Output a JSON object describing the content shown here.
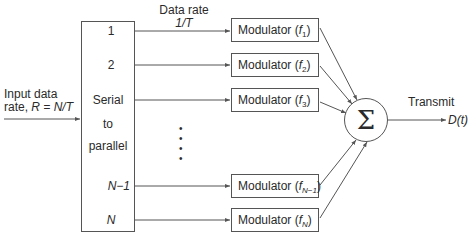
{
  "diagram": {
    "input": {
      "label_line1": "Input data",
      "label_line2_prefix": "rate, ",
      "label_line2_math": "R = N/T"
    },
    "data_rate": {
      "label_line1": "Data rate",
      "label_line2": "1/T"
    },
    "serial_to_parallel": {
      "line1": "Serial",
      "line2": "to",
      "line3": "parallel",
      "outputs": [
        "1",
        "2",
        "N−1",
        "N"
      ]
    },
    "ellipsis": "•",
    "modulators": [
      {
        "label": "Modulator (",
        "freq": "f",
        "sub": "1",
        "close": ")"
      },
      {
        "label": "Modulator (",
        "freq": "f",
        "sub": "2",
        "close": ")"
      },
      {
        "label": "Modulator (",
        "freq": "f",
        "sub": "3",
        "close": ")"
      },
      {
        "label": "Modulator (",
        "freq": "f",
        "sub": "N−1",
        "close": ")"
      },
      {
        "label": "Modulator (",
        "freq": "f",
        "sub": "N",
        "close": ")"
      }
    ],
    "summer": {
      "symbol": "Σ"
    },
    "output": {
      "label": "Transmit",
      "signal": "D(t)"
    },
    "colors": {
      "line": "#555555",
      "text": "#2a2a2a",
      "background": "#ffffff"
    }
  }
}
